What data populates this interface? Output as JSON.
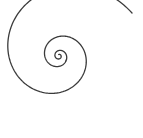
{
  "figure": {
    "type": "spiral",
    "stroke_color": "#3a3a3a",
    "stroke_width": 1.3,
    "background": "#ffffff",
    "center": [
      59,
      56
    ],
    "outer_end": [
      132,
      13
    ],
    "turns": 3.2
  }
}
